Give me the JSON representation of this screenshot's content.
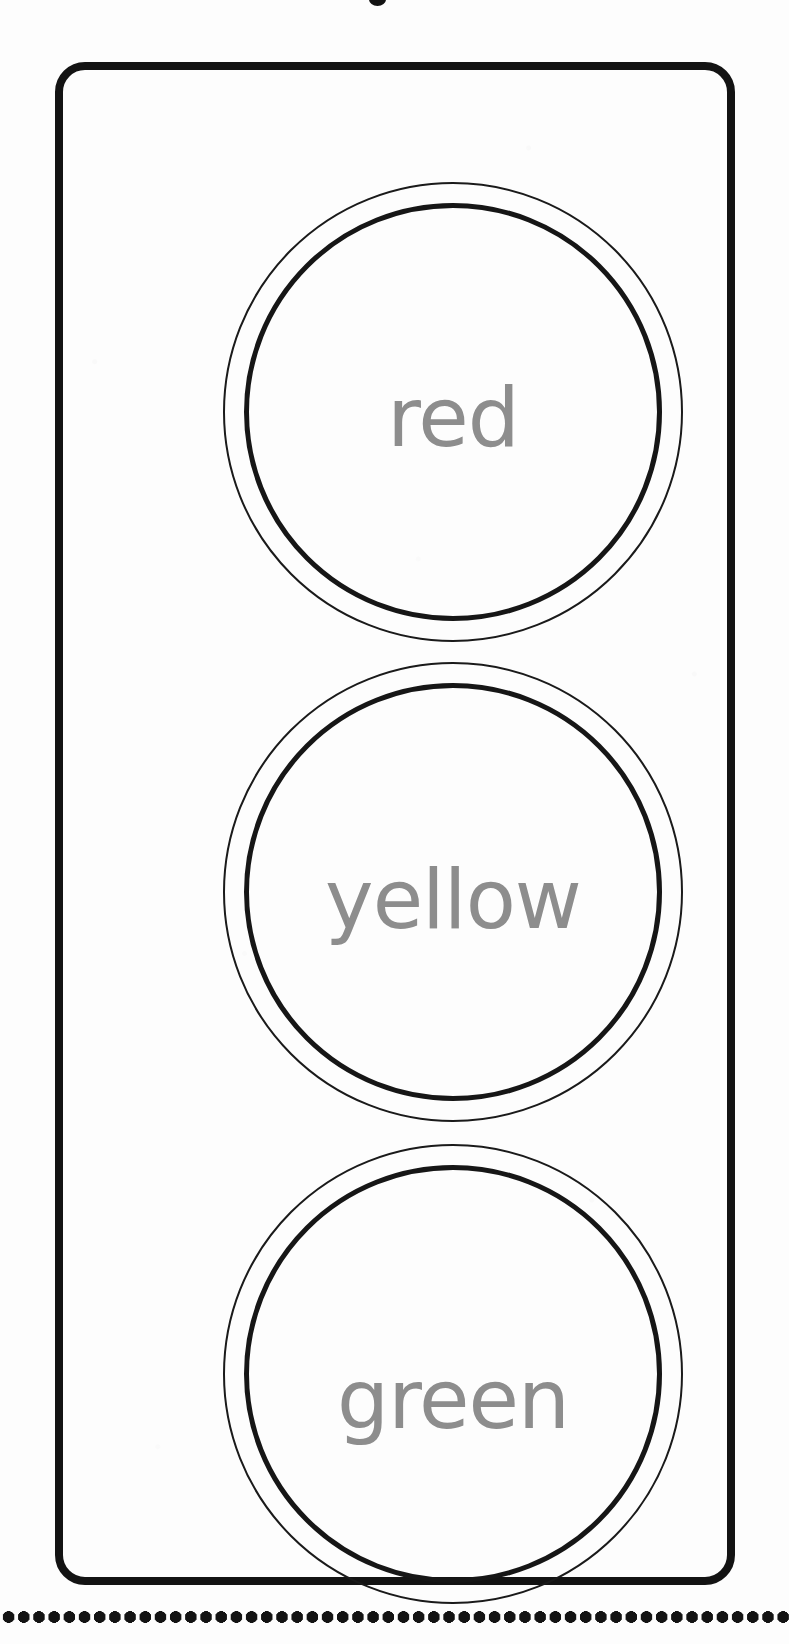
{
  "worksheet": {
    "title": "traffic light",
    "background_color": "#fdfdfd",
    "ink_color": "#131313",
    "label_color": "#8d8d8d"
  },
  "housing": {
    "name": "traffic-light-body",
    "shape": "rounded-rectangle"
  },
  "lights": [
    {
      "id": "red",
      "label": "red",
      "position": "top",
      "outer_ring": "thin-circle",
      "inner_ring": "thick-circle"
    },
    {
      "id": "yellow",
      "label": "yellow",
      "position": "middle",
      "outer_ring": "thin-circle",
      "inner_ring": "thick-circle"
    },
    {
      "id": "green",
      "label": "green",
      "position": "bottom",
      "outer_ring": "thin-circle",
      "inner_ring": "thick-circle"
    }
  ],
  "cut_line": {
    "name": "dotted-cut-line",
    "style": "dotted"
  }
}
